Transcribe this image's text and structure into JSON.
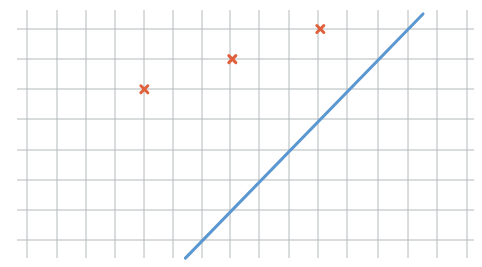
{
  "chart_data": {
    "type": "scatter",
    "title": "",
    "xlabel": "",
    "ylabel": "",
    "grid": true,
    "grid_cols": 16,
    "grid_rows": 8,
    "points": [
      {
        "x": 4,
        "y": 5
      },
      {
        "x": 7,
        "y": 6
      },
      {
        "x": 10,
        "y": 7
      }
    ],
    "line": {
      "x1": 5.4,
      "y1": -0.6,
      "x2": 13.5,
      "y2": 7.5,
      "slope": 1,
      "intercept": -6
    }
  },
  "layout": {
    "grid_x": [
      27,
      57,
      86,
      115,
      144,
      173,
      202,
      230,
      259,
      289,
      318,
      347,
      378,
      408,
      437,
      467
    ],
    "grid_y": [
      29,
      59,
      89,
      119,
      150,
      180,
      210,
      240
    ],
    "grid_left": 17,
    "grid_right": 474,
    "grid_top": 10,
    "grid_bottom": 258
  },
  "colors": {
    "grid": "#b4b9bc",
    "marker": "#e0603c",
    "line": "#5b97d0",
    "background": "#ffffff"
  }
}
